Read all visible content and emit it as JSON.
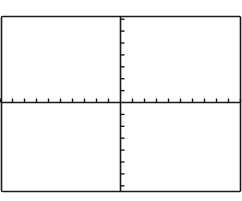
{
  "chart_data": {
    "type": "line",
    "title": "",
    "xlabel": "",
    "ylabel": "",
    "series": [],
    "xlim": [
      -10,
      10
    ],
    "ylim": [
      -7,
      7
    ],
    "x_ticks": [
      -10,
      -9,
      -8,
      -7,
      -6,
      -5,
      -4,
      -3,
      -2,
      -1,
      1,
      2,
      3,
      4,
      5,
      6,
      7,
      8,
      9,
      10
    ],
    "y_ticks": [
      -7,
      -6,
      -5,
      -4,
      -3,
      -2,
      -1,
      1,
      2,
      3,
      4,
      5,
      6,
      7
    ],
    "grid": false,
    "legend": null
  },
  "colors": {
    "axis": "#1a1a1a",
    "frame": "#1a1a1a",
    "background": "#ffffff"
  }
}
